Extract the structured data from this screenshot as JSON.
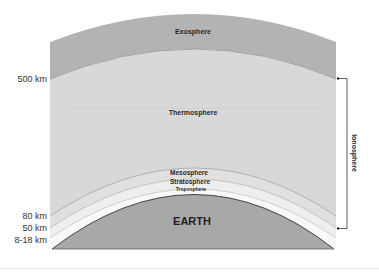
{
  "diagram": {
    "layers": [
      {
        "name": "Exosphere",
        "color": "#b3b3b3"
      },
      {
        "name": "Thermosphere",
        "color": "#d6d6d6"
      },
      {
        "name": "Mesosphere",
        "color": "#dedede"
      },
      {
        "name": "Stratosphere",
        "color": "#ececec"
      },
      {
        "name": "Troposphere",
        "color": "#f6f6f6"
      }
    ],
    "earth": {
      "label": "EARTH",
      "color": "#a8a8a8"
    },
    "altitudes": [
      {
        "label": "500 km"
      },
      {
        "label": "80 km"
      },
      {
        "label": "50 km"
      },
      {
        "label": "8-18 km"
      }
    ],
    "bracket": {
      "label": "Ionosphere"
    }
  }
}
